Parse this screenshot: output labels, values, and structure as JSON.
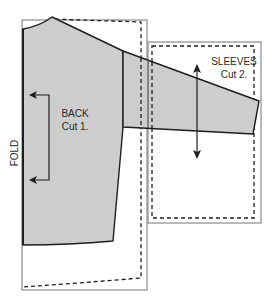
{
  "diagram": {
    "type": "sewing-pattern-layout",
    "colors": {
      "background": "#ffffff",
      "piece_fill": "#cdcdcd",
      "piece_stroke": "#1e1e1e",
      "outline_stroke": "#8a8a8a",
      "cut_line": "#1e1e1e"
    },
    "pieces": [
      {
        "id": "back",
        "label_line1": "BACK",
        "label_line2": "Cut 1."
      },
      {
        "id": "sleeves",
        "label_line1": "SLEEVES",
        "label_line2": "Cut 2."
      }
    ],
    "fold_label": "FOLD",
    "grainlines": [
      {
        "piece": "back",
        "style": "fold-bracket",
        "icon": "fold-arrow-icon"
      },
      {
        "piece": "sleeves",
        "style": "double-arrow",
        "icon": "grainline-arrow-icon"
      }
    ]
  }
}
